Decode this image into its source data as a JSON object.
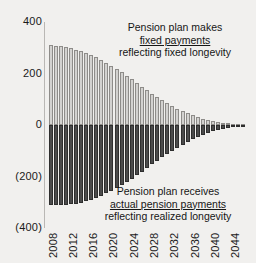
{
  "chart_data": {
    "type": "bar",
    "title": "",
    "subtitle": "",
    "xlabel": "",
    "ylabel": "",
    "ylim": [
      -400,
      400
    ],
    "yticks": [
      400,
      200,
      0,
      -200,
      -400
    ],
    "ytick_labels": [
      "400",
      "200",
      "0",
      "(200)",
      "(400)"
    ],
    "grid": false,
    "legend": "none",
    "stacked_diverging": true,
    "x_tick_step_years": 4,
    "categories": [
      "2008",
      "2009",
      "2010",
      "2011",
      "2012",
      "2013",
      "2014",
      "2015",
      "2016",
      "2017",
      "2018",
      "2019",
      "2020",
      "2021",
      "2022",
      "2023",
      "2024",
      "2025",
      "2026",
      "2027",
      "2028",
      "2029",
      "2030",
      "2031",
      "2032",
      "2033",
      "2034",
      "2035",
      "2036",
      "2037",
      "2038",
      "2039",
      "2040",
      "2041",
      "2042",
      "2043",
      "2044",
      "2045",
      "2046"
    ],
    "xtick_labels": [
      "2008",
      "2012",
      "2016",
      "2020",
      "2024",
      "2028",
      "2032",
      "2036",
      "2040",
      "2044"
    ],
    "series": [
      {
        "name": "fixed payments",
        "color": "#d3d2d0",
        "values": [
          310,
          308,
          305,
          302,
          298,
          293,
          287,
          280,
          272,
          263,
          253,
          242,
          230,
          218,
          205,
          191,
          177,
          163,
          149,
          135,
          121,
          108,
          96,
          84,
          73,
          63,
          54,
          45,
          37,
          30,
          24,
          19,
          15,
          11,
          8,
          6,
          4,
          3,
          2
        ]
      },
      {
        "name": "actual pension payments",
        "color": "#4b4b4b",
        "values": [
          -312,
          -312,
          -311,
          -310,
          -308,
          -305,
          -301,
          -296,
          -290,
          -283,
          -275,
          -266,
          -256,
          -245,
          -233,
          -221,
          -208,
          -195,
          -181,
          -167,
          -153,
          -139,
          -126,
          -113,
          -100,
          -88,
          -77,
          -66,
          -56,
          -47,
          -39,
          -32,
          -25,
          -20,
          -15,
          -11,
          -8,
          -5,
          -3
        ]
      }
    ]
  },
  "annotations": {
    "top": {
      "line1": "Pension plan makes",
      "line2": "fixed payments",
      "line3": "reflecting fixed longevity"
    },
    "bottom": {
      "line1": "Pension plan receives",
      "line2": "actual pension payments",
      "line3": "reflecting realized longevity"
    }
  }
}
